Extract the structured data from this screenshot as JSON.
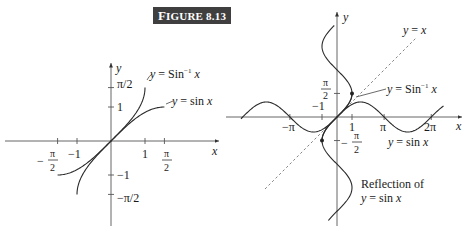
{
  "figure": {
    "title_first": "F",
    "title_rest": "IGURE 8.13"
  },
  "left_plot": {
    "x_axis_label": "x",
    "y_axis_label": "y",
    "x_ticks": [
      {
        "value": -1.5708,
        "label_num": "π",
        "label_den": "2",
        "label_sign": "−"
      },
      {
        "value": -1,
        "label": "−1"
      },
      {
        "value": 1,
        "label": "1"
      },
      {
        "value": 1.5708,
        "label_num": "π",
        "label_den": "2",
        "label_sign": ""
      }
    ],
    "y_ticks": [
      {
        "value": 1.5708,
        "label": "π/2"
      },
      {
        "value": 1,
        "label": "1"
      },
      {
        "value": -1,
        "label": "−1"
      },
      {
        "value": -1.5708,
        "label": "−π/2"
      }
    ],
    "curves": [
      {
        "name": "arcsin",
        "label": "y = Sin⁻¹ x",
        "function": "asin",
        "domain": [
          -1,
          1
        ]
      },
      {
        "name": "sin",
        "label": "y = sin x",
        "function": "sin",
        "domain": [
          -1.5708,
          1.5708
        ]
      }
    ],
    "labels": {
      "arcsin": {
        "y": "y",
        "eq": " = Sin",
        "sup": "−1",
        "x": " x"
      },
      "sin": {
        "y": "y",
        "eq": " = sin ",
        "x": "x"
      }
    }
  },
  "right_plot": {
    "x_axis_label": "x",
    "y_axis_label": "y",
    "x_ticks": [
      {
        "value": -3.1416,
        "label": "−π"
      },
      {
        "value": -1,
        "label": "−1"
      },
      {
        "value": 1,
        "label": "1"
      },
      {
        "value": 3.1416,
        "label": "π"
      },
      {
        "value": 6.2832,
        "label": "2π"
      }
    ],
    "y_ticks": [
      {
        "value": 1.5708,
        "label_num": "π",
        "label_den": "2",
        "label_sign": ""
      },
      {
        "value": -1.5708,
        "label_num": "π",
        "label_den": "2",
        "label_sign": "−"
      }
    ],
    "curves": [
      {
        "name": "sin",
        "label": "y = sin x",
        "function": "sin",
        "domain": [
          -6.4,
          7.1
        ]
      },
      {
        "name": "reflection",
        "label": "Reflection of y = sin x",
        "function": "x = sin y",
        "range": [
          -6.9,
          6.1
        ]
      },
      {
        "name": "arcsin",
        "label": "y = Sin⁻¹ x",
        "function": "asin",
        "domain": [
          -1,
          1
        ]
      },
      {
        "name": "identity",
        "label": "y = x",
        "function": "x",
        "style": "dashed",
        "domain": [
          -4.8,
          5.3
        ]
      }
    ],
    "points": [
      {
        "x": 1,
        "y": 1.5708
      },
      {
        "x": -1,
        "y": -1.5708
      }
    ],
    "labels": {
      "identity": {
        "y": "y",
        "eq": " = ",
        "x": "x"
      },
      "arcsin": {
        "y": "y",
        "eq": " = Sin",
        "sup": "−1",
        "x": " x"
      },
      "sin": {
        "y": "y",
        "eq": " = sin ",
        "x": "x"
      },
      "reflection_line1": "Reflection of",
      "reflection_line2": {
        "y": "y",
        "eq": " = sin ",
        "x": "x"
      }
    }
  }
}
